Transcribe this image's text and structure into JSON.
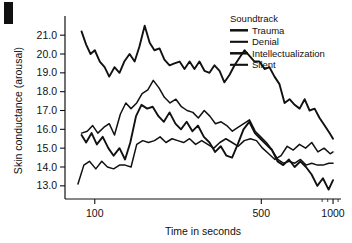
{
  "figure": {
    "panel_label": "",
    "background": "#ffffff",
    "ink_color": "#111111"
  },
  "chart_data": {
    "type": "line",
    "title": "",
    "xlabel": "Time in seconds",
    "ylabel": "Skin conductance (arousal)",
    "xscale": "log",
    "xlim": [
      75,
      1080
    ],
    "ylim": [
      12.3,
      21.7
    ],
    "grid": false,
    "legend_title": "Soundtrack",
    "legend_position": "top-right",
    "xticks": [
      100,
      500,
      1000
    ],
    "xtick_labels": [
      "100",
      "500",
      "1000"
    ],
    "xticks_minor": [
      900,
      950,
      1050
    ],
    "yticks": [
      13.0,
      14.0,
      15.0,
      16.0,
      17.0,
      18.0,
      19.0,
      20.0,
      21.0
    ],
    "ytick_labels": [
      "13.0",
      "14.0",
      "15.0",
      "16.0",
      "17.0",
      "18.0",
      "19.0",
      "20.0",
      "21.0"
    ],
    "series": [
      {
        "name": "Trauma",
        "stroke_width": 1.9,
        "dash": "none",
        "x": [
          88,
          92,
          96,
          100,
          105,
          110,
          115,
          121,
          127,
          133,
          140,
          147,
          154,
          162,
          170,
          178,
          187,
          196,
          206,
          216,
          227,
          238,
          250,
          262,
          275,
          289,
          303,
          318,
          334,
          350,
          368,
          386,
          405,
          425,
          446,
          468,
          491,
          516,
          541,
          568,
          596,
          626,
          657,
          690,
          724,
          760,
          797,
          837,
          878,
          922,
          967,
          1000
        ],
        "y": [
          21.2,
          20.5,
          20.0,
          20.2,
          19.6,
          19.3,
          18.8,
          19.3,
          19.0,
          19.6,
          20.0,
          19.6,
          20.4,
          21.5,
          20.6,
          20.2,
          20.3,
          19.7,
          19.4,
          19.5,
          19.6,
          19.2,
          19.6,
          19.2,
          19.6,
          19.1,
          19.0,
          19.4,
          19.1,
          18.5,
          18.9,
          19.4,
          19.8,
          20.2,
          19.9,
          19.6,
          19.6,
          19.2,
          19.3,
          18.8,
          18.4,
          17.4,
          17.6,
          17.3,
          17.1,
          17.6,
          17.0,
          17.1,
          16.6,
          16.2,
          15.8,
          15.5
        ]
      },
      {
        "name": "Denial",
        "stroke_width": 1.5,
        "dash": "none",
        "x": [
          88,
          93,
          98,
          103,
          109,
          115,
          121,
          128,
          135,
          142,
          150,
          158,
          167,
          176,
          186,
          196,
          207,
          219,
          231,
          244,
          258,
          272,
          288,
          304,
          321,
          339,
          358,
          378,
          399,
          422,
          446,
          471,
          497,
          525,
          555,
          586,
          619,
          654,
          691,
          730,
          771,
          814,
          860,
          908,
          959,
          1000
        ],
        "y": [
          15.8,
          15.9,
          16.2,
          15.8,
          16.1,
          16.3,
          15.7,
          16.8,
          17.4,
          17.1,
          17.4,
          17.9,
          18.1,
          18.6,
          18.2,
          17.7,
          17.4,
          17.6,
          17.2,
          17.0,
          16.9,
          16.6,
          17.0,
          16.7,
          16.3,
          16.4,
          16.2,
          15.9,
          16.1,
          16.3,
          16.5,
          15.9,
          15.6,
          15.3,
          14.9,
          14.4,
          14.2,
          14.3,
          14.2,
          14.4,
          14.1,
          14.2,
          14.1,
          14.1,
          14.2,
          14.2
        ]
      },
      {
        "name": "Intellectualization",
        "stroke_width": 1.9,
        "dash": "none",
        "x": [
          88,
          92,
          97,
          102,
          108,
          114,
          120,
          127,
          134,
          141,
          149,
          157,
          166,
          175,
          185,
          195,
          206,
          218,
          230,
          243,
          257,
          271,
          287,
          303,
          320,
          338,
          357,
          377,
          398,
          421,
          445,
          470,
          496,
          524,
          554,
          585,
          618,
          653,
          690,
          729,
          770,
          813,
          859,
          907,
          958,
          1000
        ],
        "y": [
          15.7,
          15.3,
          15.8,
          15.2,
          15.6,
          15.0,
          14.6,
          15.0,
          14.4,
          15.3,
          16.7,
          17.3,
          17.1,
          17.2,
          16.7,
          16.4,
          16.9,
          16.3,
          16.0,
          16.4,
          15.9,
          16.2,
          15.6,
          15.3,
          14.8,
          15.1,
          14.6,
          14.5,
          15.2,
          16.0,
          16.4,
          15.8,
          15.5,
          15.2,
          14.9,
          14.3,
          14.1,
          14.4,
          14.0,
          14.3,
          14.0,
          13.6,
          13.0,
          13.4,
          12.8,
          13.3
        ]
      },
      {
        "name": "Silent",
        "stroke_width": 1.5,
        "dash": "none",
        "x": [
          85,
          90,
          95,
          101,
          107,
          113,
          120,
          127,
          134,
          142,
          150,
          159,
          168,
          178,
          188,
          199,
          211,
          223,
          236,
          250,
          265,
          281,
          298,
          316,
          335,
          355,
          377,
          400,
          424,
          450,
          477,
          506,
          537,
          570,
          605,
          642,
          681,
          723,
          767,
          814,
          864,
          917,
          973,
          1000
        ],
        "y": [
          13.1,
          14.1,
          14.3,
          13.9,
          14.3,
          14.0,
          13.9,
          14.1,
          14.1,
          14.0,
          15.2,
          15.4,
          15.3,
          15.4,
          15.6,
          15.3,
          15.5,
          15.4,
          15.3,
          15.5,
          15.2,
          15.4,
          15.2,
          15.0,
          15.3,
          15.5,
          15.3,
          15.1,
          15.4,
          15.5,
          15.4,
          15.0,
          14.7,
          14.4,
          14.6,
          15.1,
          14.9,
          15.2,
          15.0,
          15.3,
          14.8,
          15.0,
          14.7,
          14.8
        ]
      }
    ]
  }
}
